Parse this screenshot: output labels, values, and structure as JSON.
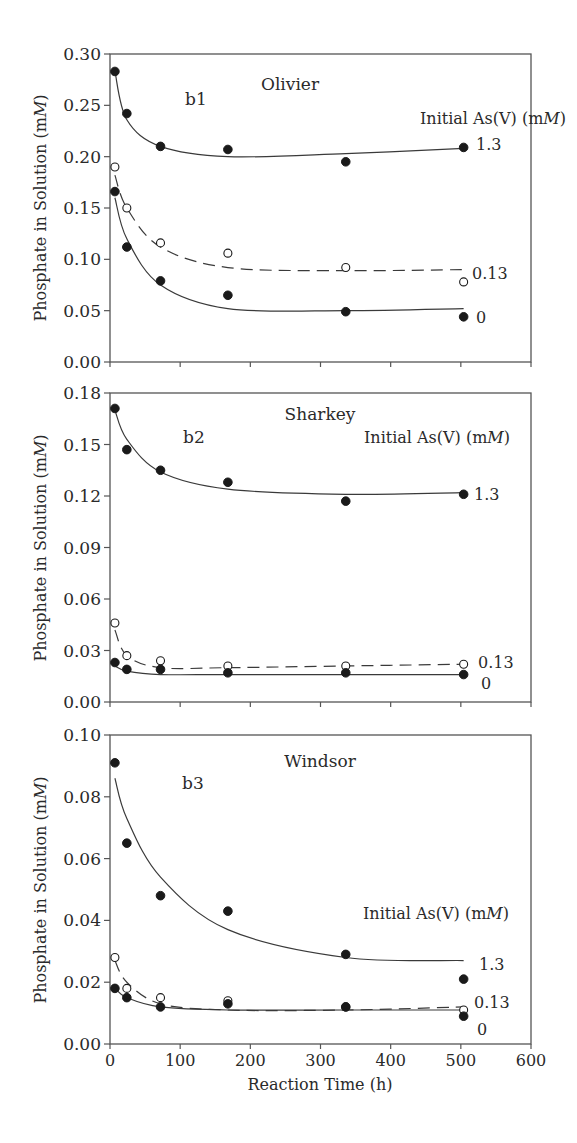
{
  "figure": {
    "x_axis": {
      "label": "Reaction Time (h)",
      "ticks": [
        0,
        100,
        200,
        300,
        400,
        500,
        600
      ],
      "tick_labels": [
        "0",
        "100",
        "200",
        "300",
        "400",
        "500",
        "600"
      ],
      "range": [
        0,
        600
      ]
    },
    "y_axis_label": "Phosphate in Solution (mM)",
    "legend_title": "Initial As(V) (mM)"
  },
  "chart_data": [
    {
      "type": "scatter",
      "panel_id": "b1",
      "title": "Olivier",
      "xlabel": "Reaction Time (h)",
      "ylabel": "Phosphate in Solution (mM)",
      "xlim": [
        0,
        600
      ],
      "ylim": [
        0,
        0.3
      ],
      "y_ticks": [
        "0.00",
        "0.05",
        "0.10",
        "0.15",
        "0.20",
        "0.25",
        "0.30"
      ],
      "legend_title": "Initial As(V) (mM)",
      "x": [
        7,
        24,
        72,
        168,
        336,
        504
      ],
      "series": [
        {
          "name": "1.3",
          "marker": "filled",
          "line": "solid",
          "values": [
            0.283,
            0.242,
            0.21,
            0.207,
            0.195,
            0.209
          ],
          "fit": [
            0.283,
            0.236,
            0.21,
            0.2,
            0.203,
            0.208
          ]
        },
        {
          "name": "0.13",
          "marker": "open",
          "line": "dashed",
          "values": [
            0.19,
            0.15,
            0.116,
            0.106,
            0.092,
            0.078
          ],
          "fit": [
            0.182,
            0.15,
            0.112,
            0.092,
            0.089,
            0.09
          ]
        },
        {
          "name": "0",
          "marker": "filled",
          "line": "solid",
          "values": [
            0.166,
            0.112,
            0.079,
            0.065,
            0.049,
            0.044
          ],
          "fit": [
            0.16,
            0.12,
            0.075,
            0.052,
            0.05,
            0.052
          ]
        }
      ]
    },
    {
      "type": "scatter",
      "panel_id": "b2",
      "title": "Sharkey",
      "xlabel": "Reaction Time (h)",
      "ylabel": "Phosphate in Solution (mM)",
      "xlim": [
        0,
        600
      ],
      "ylim": [
        0,
        0.18
      ],
      "y_ticks": [
        "0.00",
        "0.03",
        "0.06",
        "0.09",
        "0.12",
        "0.15",
        "0.18"
      ],
      "legend_title": "Initial As(V) (mM)",
      "x": [
        7,
        24,
        72,
        168,
        336,
        504
      ],
      "series": [
        {
          "name": "1.3",
          "marker": "filled",
          "line": "solid",
          "values": [
            0.171,
            0.147,
            0.135,
            0.128,
            0.117,
            0.121
          ],
          "fit": [
            0.17,
            0.153,
            0.134,
            0.124,
            0.121,
            0.122
          ]
        },
        {
          "name": "0.13",
          "marker": "open",
          "line": "dashed",
          "values": [
            0.046,
            0.027,
            0.024,
            0.021,
            0.021,
            0.022
          ],
          "fit": [
            0.042,
            0.027,
            0.02,
            0.02,
            0.021,
            0.022
          ]
        },
        {
          "name": "0",
          "marker": "filled",
          "line": "solid",
          "values": [
            0.023,
            0.019,
            0.019,
            0.017,
            0.017,
            0.016
          ],
          "fit": [
            0.021,
            0.018,
            0.016,
            0.016,
            0.016,
            0.016
          ]
        }
      ]
    },
    {
      "type": "scatter",
      "panel_id": "b3",
      "title": "Windsor",
      "xlabel": "Reaction Time (h)",
      "ylabel": "Phosphate in Solution (mM)",
      "xlim": [
        0,
        600
      ],
      "ylim": [
        0,
        0.1
      ],
      "y_ticks": [
        "0.00",
        "0.02",
        "0.04",
        "0.06",
        "0.08",
        "0.10"
      ],
      "legend_title": "Initial As(V) (mM)",
      "x": [
        7,
        24,
        72,
        168,
        336,
        504
      ],
      "series": [
        {
          "name": "1.3",
          "marker": "filled",
          "line": "solid",
          "values": [
            0.091,
            0.065,
            0.048,
            0.043,
            0.029,
            0.021
          ],
          "fit": [
            0.086,
            0.073,
            0.054,
            0.037,
            0.028,
            0.027
          ]
        },
        {
          "name": "0.13",
          "marker": "open",
          "line": "dashed",
          "values": [
            0.028,
            0.018,
            0.015,
            0.014,
            0.012,
            0.011
          ],
          "fit": [
            0.027,
            0.02,
            0.013,
            0.011,
            0.011,
            0.012
          ]
        },
        {
          "name": "0",
          "marker": "filled",
          "line": "solid",
          "values": [
            0.018,
            0.015,
            0.012,
            0.013,
            0.012,
            0.009
          ],
          "fit": [
            0.018,
            0.015,
            0.012,
            0.011,
            0.011,
            0.011
          ]
        }
      ]
    }
  ]
}
